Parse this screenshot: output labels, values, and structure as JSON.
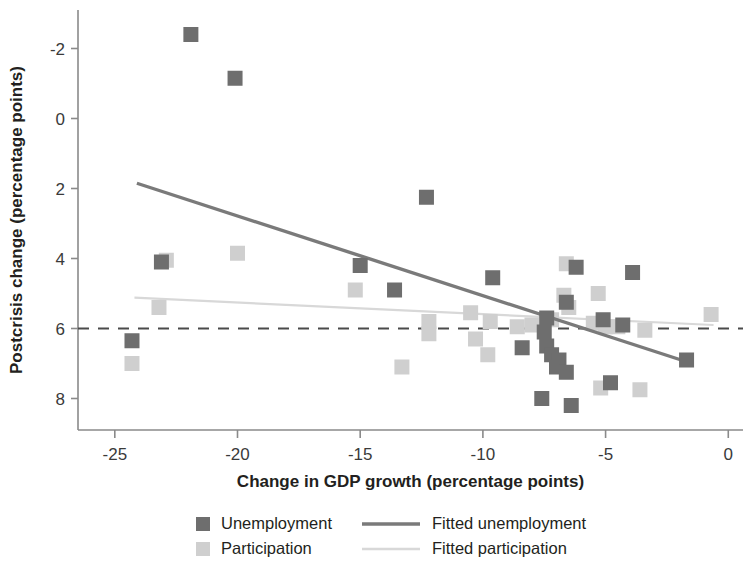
{
  "chart": {
    "xlabel": "Change in GDP growth (percentage points)",
    "ylabel": "Postcrisis change (percentage points)",
    "xticks": [
      "-25",
      "-20",
      "-15",
      "-10",
      "-5",
      "0"
    ],
    "yticks": [
      "8",
      "6",
      "4",
      "2",
      "0",
      "-2"
    ]
  },
  "legend": {
    "unemployment": "Unemployment",
    "participation": "Participation",
    "fitted_unemployment": "Fitted unemployment",
    "fitted_participation": "Fitted participation"
  },
  "colors": {
    "unemployment": "#6e6e6e",
    "participation": "#cfcfcf",
    "fitted_unemployment": "#7a7a7a",
    "fitted_participation": "#d8d8d8",
    "axis": "#8a8a8a",
    "zero_line": "#4a4a4a",
    "text": "#231f20"
  },
  "chart_data": {
    "type": "scatter",
    "title": "",
    "xlabel": "Change in GDP growth (percentage points)",
    "ylabel": "Postcrisis change (percentage points)",
    "xlim": [
      -26.5,
      0.6
    ],
    "ylim": [
      -2.9,
      9.1
    ],
    "xticks": [
      -25,
      -20,
      -15,
      -10,
      -5,
      0
    ],
    "yticks": [
      -2,
      0,
      2,
      4,
      6,
      8
    ],
    "grid": false,
    "legend_position": "bottom",
    "reference_lines": [
      {
        "name": "zero-line",
        "orientation": "horizontal",
        "y": 0,
        "style": "dashed",
        "color": "#4a4a4a"
      }
    ],
    "series": [
      {
        "name": "Unemployment",
        "type": "scatter",
        "marker": "square",
        "color": "#6e6e6e",
        "points": [
          [
            -21.9,
            8.4
          ],
          [
            -20.1,
            7.15
          ],
          [
            -12.3,
            3.75
          ],
          [
            -23.1,
            1.9
          ],
          [
            -15.0,
            1.8
          ],
          [
            -13.6,
            1.1
          ],
          [
            -9.6,
            1.45
          ],
          [
            -6.2,
            1.75
          ],
          [
            -3.9,
            1.6
          ],
          [
            -6.6,
            0.75
          ],
          [
            -7.4,
            0.3
          ],
          [
            -5.1,
            0.25
          ],
          [
            -4.3,
            0.1
          ],
          [
            -7.5,
            -0.1
          ],
          [
            -7.4,
            -0.5
          ],
          [
            -8.4,
            -0.55
          ],
          [
            -7.2,
            -0.75
          ],
          [
            -6.9,
            -0.9
          ],
          [
            -7.0,
            -1.1
          ],
          [
            -6.6,
            -1.25
          ],
          [
            -4.8,
            -1.55
          ],
          [
            -1.7,
            -0.9
          ],
          [
            -24.3,
            -0.35
          ],
          [
            -7.6,
            -2.0
          ],
          [
            -6.4,
            -2.2
          ]
        ]
      },
      {
        "name": "Participation",
        "type": "scatter",
        "marker": "square",
        "color": "#cfcfcf",
        "points": [
          [
            -22.9,
            1.95
          ],
          [
            -20.0,
            2.15
          ],
          [
            -15.2,
            1.1
          ],
          [
            -12.2,
            0.2
          ],
          [
            -12.2,
            -0.15
          ],
          [
            -13.3,
            -1.1
          ],
          [
            -10.5,
            0.45
          ],
          [
            -9.7,
            0.2
          ],
          [
            -8.6,
            0.05
          ],
          [
            -8.0,
            0.1
          ],
          [
            -7.2,
            0.25
          ],
          [
            -6.6,
            1.85
          ],
          [
            -6.7,
            0.95
          ],
          [
            -6.5,
            0.6
          ],
          [
            -5.3,
            1.0
          ],
          [
            -5.5,
            0.15
          ],
          [
            -5.0,
            0.05
          ],
          [
            -4.5,
            0.05
          ],
          [
            -0.7,
            0.4
          ],
          [
            -23.2,
            0.6
          ],
          [
            -24.3,
            -1.0
          ],
          [
            -10.3,
            -0.3
          ],
          [
            -9.8,
            -0.75
          ],
          [
            -5.2,
            -1.7
          ],
          [
            -3.6,
            -1.75
          ],
          [
            -3.4,
            -0.05
          ]
        ]
      },
      {
        "name": "Fitted unemployment",
        "type": "line",
        "color": "#7a7a7a",
        "endpoints": [
          [
            -24.1,
            4.15
          ],
          [
            -1.7,
            -0.95
          ]
        ]
      },
      {
        "name": "Fitted participation",
        "type": "line",
        "color": "#d8d8d8",
        "endpoints": [
          [
            -24.2,
            0.88
          ],
          [
            -0.6,
            0.1
          ]
        ]
      }
    ]
  }
}
